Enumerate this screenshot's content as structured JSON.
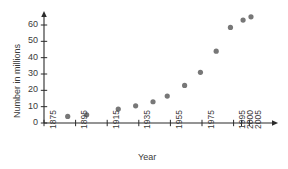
{
  "chart_data": {
    "type": "scatter",
    "title": "",
    "xlabel": "Year",
    "ylabel": "Number in millions",
    "xlim": [
      1875,
      2008
    ],
    "ylim": [
      0,
      68
    ],
    "grid": false,
    "legend": null,
    "marker_color": "#777777",
    "axis_color": "#2b2b2b",
    "x_tick_labels": [
      "1875",
      "1895",
      "1915",
      "1935",
      "1955",
      "1975",
      "1995",
      "2000",
      "2005"
    ],
    "x_tick_values": [
      1875,
      1895,
      1915,
      1935,
      1955,
      1975,
      1995,
      2000,
      2005
    ],
    "y_tick_labels": [
      "0",
      "10",
      "20",
      "30",
      "40",
      "50",
      "60"
    ],
    "y_tick_values": [
      0,
      10,
      20,
      30,
      40,
      50,
      60
    ],
    "points": [
      {
        "x": 1890,
        "y": 4
      },
      {
        "x": 1902,
        "y": 5
      },
      {
        "x": 1922,
        "y": 8.5
      },
      {
        "x": 1933,
        "y": 10.5
      },
      {
        "x": 1944,
        "y": 13
      },
      {
        "x": 1953,
        "y": 16.5
      },
      {
        "x": 1964,
        "y": 23
      },
      {
        "x": 1974,
        "y": 31
      },
      {
        "x": 1984,
        "y": 44
      },
      {
        "x": 1993,
        "y": 58.5
      },
      {
        "x": 2001,
        "y": 63
      },
      {
        "x": 2006,
        "y": 65
      }
    ]
  }
}
